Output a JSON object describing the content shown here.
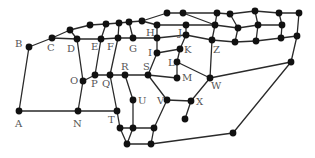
{
  "diagram": {
    "type": "graph",
    "node_color": "#111111",
    "edge_color": "#2a2a2a",
    "label_color": "#555555",
    "nodes": [
      {
        "id": "A",
        "label": "A",
        "x": 19,
        "y": 111,
        "lx": 15,
        "ly": 127
      },
      {
        "id": "B",
        "label": "B",
        "x": 29,
        "y": 47,
        "lx": 15,
        "ly": 47
      },
      {
        "id": "C",
        "label": "C",
        "x": 52,
        "y": 38,
        "lx": 47,
        "ly": 51
      },
      {
        "id": "c1",
        "label": "",
        "x": 70,
        "y": 30
      },
      {
        "id": "D",
        "label": "D",
        "x": 77,
        "y": 39,
        "lx": 67,
        "ly": 52
      },
      {
        "id": "u1",
        "label": "",
        "x": 90,
        "y": 25
      },
      {
        "id": "u2",
        "label": "",
        "x": 106,
        "y": 24
      },
      {
        "id": "u3",
        "label": "",
        "x": 119,
        "y": 23
      },
      {
        "id": "u4",
        "label": "",
        "x": 129,
        "y": 22
      },
      {
        "id": "u5",
        "label": "",
        "x": 142,
        "y": 21
      },
      {
        "id": "u6",
        "label": "",
        "x": 157,
        "y": 25
      },
      {
        "id": "E",
        "label": "E",
        "x": 101,
        "y": 39,
        "lx": 91,
        "ly": 50
      },
      {
        "id": "F",
        "label": "F",
        "x": 118,
        "y": 38,
        "lx": 107,
        "ly": 50
      },
      {
        "id": "G",
        "label": "G",
        "x": 133,
        "y": 38,
        "lx": 129,
        "ly": 52
      },
      {
        "id": "H",
        "label": "H",
        "x": 157,
        "y": 38,
        "lx": 146,
        "ly": 36
      },
      {
        "id": "t1",
        "label": "",
        "x": 167,
        "y": 13
      },
      {
        "id": "t2",
        "label": "",
        "x": 183,
        "y": 13
      },
      {
        "id": "t3",
        "label": "",
        "x": 217,
        "y": 13
      },
      {
        "id": "t4",
        "label": "",
        "x": 230,
        "y": 14
      },
      {
        "id": "t5",
        "label": "",
        "x": 255,
        "y": 11
      },
      {
        "id": "t6",
        "label": "",
        "x": 279,
        "y": 13
      },
      {
        "id": "t7",
        "label": "",
        "x": 299,
        "y": 13
      },
      {
        "id": "m1",
        "label": "",
        "x": 186,
        "y": 25
      },
      {
        "id": "m2",
        "label": "",
        "x": 215,
        "y": 25
      },
      {
        "id": "m3",
        "label": "",
        "x": 238,
        "y": 28
      },
      {
        "id": "m4",
        "label": "",
        "x": 258,
        "y": 25
      },
      {
        "id": "m5",
        "label": "",
        "x": 282,
        "y": 25
      },
      {
        "id": "J",
        "label": "J",
        "x": 186,
        "y": 35,
        "lx": 178,
        "ly": 36
      },
      {
        "id": "Z",
        "label": "Z",
        "x": 212,
        "y": 40,
        "lx": 213,
        "ly": 53
      },
      {
        "id": "b3",
        "label": "",
        "x": 235,
        "y": 42
      },
      {
        "id": "b4",
        "label": "",
        "x": 256,
        "y": 41
      },
      {
        "id": "b5",
        "label": "",
        "x": 281,
        "y": 38
      },
      {
        "id": "b6",
        "label": "",
        "x": 297,
        "y": 36
      },
      {
        "id": "I",
        "label": "I",
        "x": 157,
        "y": 53,
        "lx": 148,
        "ly": 56
      },
      {
        "id": "K",
        "label": "K",
        "x": 180,
        "y": 49,
        "lx": 184,
        "ly": 53
      },
      {
        "id": "L",
        "label": "L",
        "x": 177,
        "y": 62,
        "lx": 168,
        "ly": 66
      },
      {
        "id": "M",
        "label": "M",
        "x": 177,
        "y": 78,
        "lx": 182,
        "ly": 81
      },
      {
        "id": "W",
        "label": "W",
        "x": 210,
        "y": 78,
        "lx": 211,
        "ly": 89
      },
      {
        "id": "rw",
        "label": "",
        "x": 291,
        "y": 62
      },
      {
        "id": "O",
        "label": "O",
        "x": 83,
        "y": 81,
        "lx": 70,
        "ly": 84
      },
      {
        "id": "P",
        "label": "P",
        "x": 95,
        "y": 75,
        "lx": 91,
        "ly": 87
      },
      {
        "id": "Q",
        "label": "Q",
        "x": 110,
        "y": 75,
        "lx": 102,
        "ly": 87
      },
      {
        "id": "R",
        "label": "R",
        "x": 125,
        "y": 75,
        "lx": 121,
        "ly": 70
      },
      {
        "id": "S",
        "label": "S",
        "x": 148,
        "y": 75,
        "lx": 143,
        "ly": 70
      },
      {
        "id": "U",
        "label": "U",
        "x": 133,
        "y": 100,
        "lx": 138,
        "ly": 104
      },
      {
        "id": "V",
        "label": "V",
        "x": 167,
        "y": 100,
        "lx": 157,
        "ly": 104
      },
      {
        "id": "X",
        "label": "X",
        "x": 191,
        "y": 101,
        "lx": 196,
        "ly": 105
      },
      {
        "id": "xd",
        "label": "",
        "x": 185,
        "y": 119
      },
      {
        "id": "N",
        "label": "N",
        "x": 78,
        "y": 111,
        "lx": 73,
        "ly": 127
      },
      {
        "id": "T",
        "label": "T",
        "x": 117,
        "y": 111,
        "lx": 108,
        "ly": 123
      },
      {
        "id": "h1",
        "label": "",
        "x": 120,
        "y": 128
      },
      {
        "id": "h2",
        "label": "",
        "x": 133,
        "y": 128
      },
      {
        "id": "h3",
        "label": "",
        "x": 154,
        "y": 128
      },
      {
        "id": "h4",
        "label": "",
        "x": 127,
        "y": 144
      },
      {
        "id": "h5",
        "label": "",
        "x": 151,
        "y": 144
      },
      {
        "id": "br",
        "label": "",
        "x": 233,
        "y": 133
      }
    ],
    "edges": [
      [
        "A",
        "B"
      ],
      [
        "A",
        "N"
      ],
      [
        "B",
        "C"
      ],
      [
        "C",
        "c1"
      ],
      [
        "C",
        "D"
      ],
      [
        "c1",
        "D"
      ],
      [
        "c1",
        "u1"
      ],
      [
        "D",
        "E"
      ],
      [
        "E",
        "F"
      ],
      [
        "F",
        "G"
      ],
      [
        "G",
        "H"
      ],
      [
        "u1",
        "u2"
      ],
      [
        "u2",
        "u3"
      ],
      [
        "u3",
        "u4"
      ],
      [
        "u4",
        "u5"
      ],
      [
        "u5",
        "u6"
      ],
      [
        "u2",
        "E"
      ],
      [
        "u3",
        "F"
      ],
      [
        "u4",
        "G"
      ],
      [
        "u5",
        "t1"
      ],
      [
        "t1",
        "t2"
      ],
      [
        "t2",
        "t3"
      ],
      [
        "t3",
        "t4"
      ],
      [
        "t4",
        "t5"
      ],
      [
        "t5",
        "t6"
      ],
      [
        "t6",
        "t7"
      ],
      [
        "t2",
        "m2"
      ],
      [
        "u6",
        "m1"
      ],
      [
        "m1",
        "m2"
      ],
      [
        "u6",
        "H"
      ],
      [
        "m1",
        "J"
      ],
      [
        "t3",
        "m2"
      ],
      [
        "t4",
        "m3"
      ],
      [
        "t5",
        "m4"
      ],
      [
        "t6",
        "m5"
      ],
      [
        "m2",
        "Z"
      ],
      [
        "m3",
        "b3"
      ],
      [
        "m4",
        "b4"
      ],
      [
        "m5",
        "b5"
      ],
      [
        "m2",
        "m3"
      ],
      [
        "m3",
        "m4"
      ],
      [
        "m4",
        "m5"
      ],
      [
        "H",
        "J"
      ],
      [
        "J",
        "Z"
      ],
      [
        "Z",
        "b3"
      ],
      [
        "b3",
        "b4"
      ],
      [
        "b4",
        "b5"
      ],
      [
        "b5",
        "b6"
      ],
      [
        "t7",
        "b6"
      ],
      [
        "b6",
        "rw"
      ],
      [
        "rw",
        "W"
      ],
      [
        "rw",
        "br"
      ],
      [
        "H",
        "I"
      ],
      [
        "I",
        "K"
      ],
      [
        "J",
        "K"
      ],
      [
        "K",
        "L"
      ],
      [
        "L",
        "M"
      ],
      [
        "L",
        "W"
      ],
      [
        "Z",
        "W"
      ],
      [
        "I",
        "S"
      ],
      [
        "S",
        "M"
      ],
      [
        "S",
        "R"
      ],
      [
        "R",
        "Q"
      ],
      [
        "Q",
        "P"
      ],
      [
        "P",
        "O"
      ],
      [
        "D",
        "O"
      ],
      [
        "O",
        "N"
      ],
      [
        "E",
        "P"
      ],
      [
        "F",
        "Q"
      ],
      [
        "N",
        "T"
      ],
      [
        "Q",
        "T"
      ],
      [
        "T",
        "h1"
      ],
      [
        "R",
        "U"
      ],
      [
        "U",
        "h2"
      ],
      [
        "S",
        "V"
      ],
      [
        "V",
        "X"
      ],
      [
        "X",
        "W"
      ],
      [
        "X",
        "xd"
      ],
      [
        "V",
        "h3"
      ],
      [
        "h1",
        "h2"
      ],
      [
        "h2",
        "h3"
      ],
      [
        "h1",
        "h4"
      ],
      [
        "h2",
        "h4"
      ],
      [
        "h4",
        "h5"
      ],
      [
        "h3",
        "h5"
      ],
      [
        "h5",
        "br"
      ]
    ]
  }
}
